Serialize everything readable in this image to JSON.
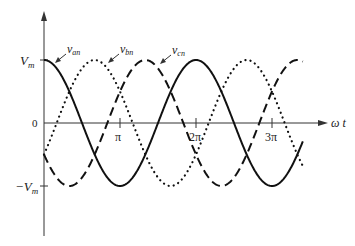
{
  "chart_data": {
    "type": "line",
    "title": "",
    "xlabel": "ω t",
    "ylabel": "",
    "x_ticks": [
      "π",
      "2π",
      "3π"
    ],
    "x_tick_values": [
      3.14159,
      6.28319,
      9.42478
    ],
    "y_ticks": [
      "V_m",
      "0",
      "−V_m"
    ],
    "y_tick_values": [
      1,
      0,
      -1
    ],
    "xlim": [
      0,
      10.7
    ],
    "ylim": [
      -1,
      1
    ],
    "grid": false,
    "legend": "inline annotations with arrows",
    "series": [
      {
        "name": "v_an",
        "style": "solid",
        "formula": "V_m cos(ωt)",
        "phase_deg": 0,
        "x": [
          0,
          1.5708,
          3.1416,
          4.7124,
          6.2832,
          7.854,
          9.4248,
          10.7
        ],
        "values": [
          1,
          0,
          -1,
          0,
          1,
          0,
          -1,
          -0.27
        ]
      },
      {
        "name": "v_bn",
        "style": "dotted",
        "formula": "V_m cos(ωt − 120°)",
        "phase_deg": -120,
        "x": [
          0,
          0.5236,
          2.0944,
          3.6652,
          5.236,
          6.8068,
          8.3776,
          9.9484,
          10.7
        ],
        "values": [
          -0.5,
          0,
          1,
          0,
          -1,
          0,
          1,
          0,
          -0.68
        ]
      },
      {
        "name": "v_cn",
        "style": "dashed",
        "formula": "V_m cos(ωt + 120°)",
        "phase_deg": 120,
        "x": [
          0,
          1.0472,
          2.618,
          4.1888,
          5.7596,
          7.3304,
          8.9012,
          10.472,
          10.7
        ],
        "values": [
          -0.5,
          -1,
          0,
          1,
          0,
          -1,
          0,
          1,
          0.97
        ]
      }
    ],
    "annotations": [
      "v_an",
      "v_bn",
      "v_cn"
    ]
  },
  "labels": {
    "vm": "V",
    "vm_sub": "m",
    "neg_vm": "−V",
    "neg_vm_sub": "m",
    "zero": "0",
    "pi": "π",
    "two_pi": "2π",
    "three_pi": "3π",
    "xaxis": "ω t",
    "van": "v",
    "van_sub": "an",
    "vbn": "v",
    "vbn_sub": "bn",
    "vcn": "v",
    "vcn_sub": "cn"
  },
  "colors": {
    "axis": "#333333",
    "curve": "#111111"
  }
}
